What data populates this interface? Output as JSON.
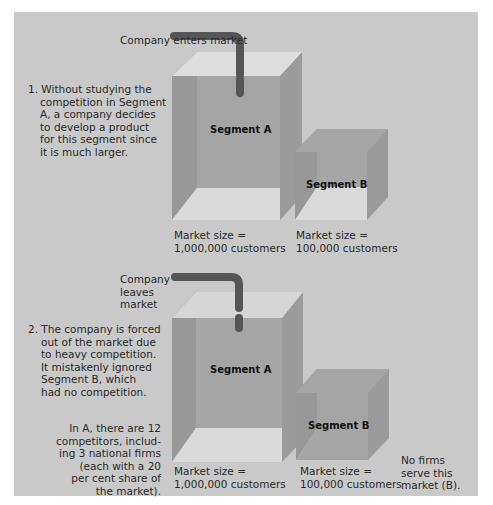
{
  "colors": {
    "background": "#c9c9c9",
    "top_face": "#dedede",
    "top_face_faded": "#d6d6d6",
    "left_wall": "#989898",
    "back_wall": "#a5a5a5",
    "right_face": "#9b9b9b",
    "floor": "#dadada",
    "pipe": "#555555"
  },
  "panel1": {
    "pipe_label": [
      "Company",
      "enters",
      "market"
    ],
    "description": [
      "1. Without studying the",
      "competition in Segment",
      "A, a company decides",
      "to develop a product",
      "for this segment since",
      "it is much larger."
    ],
    "segment_a": {
      "label": "Segment A",
      "market_size": [
        "Market size =",
        "1,000,000 customers"
      ],
      "customers": 1000000
    },
    "segment_b": {
      "label": "Segment B",
      "market_size": [
        "Market size =",
        "100,000 customers"
      ],
      "customers": 100000
    }
  },
  "panel2": {
    "pipe_label": [
      "Company",
      "leaves",
      "market"
    ],
    "description": [
      "2. The company is forced",
      "out of the market due",
      "to heavy competition.",
      "It mistakenly ignored",
      "Segment B, which",
      "had no competition."
    ],
    "competition_note": [
      "In A, there are 12",
      "competitors, includ-",
      "ing 3 national firms",
      "(each with a 20",
      "per cent share of",
      "the market)."
    ],
    "segment_a": {
      "label": "Segment A",
      "market_size": [
        "Market size =",
        "1,000,000 customers"
      ],
      "customers": 1000000
    },
    "segment_b": {
      "label": "Segment B",
      "market_size": [
        "Market size =",
        "100,000 customers"
      ],
      "customers": 100000
    },
    "segment_b_note": [
      "No firms",
      "serve this",
      "market (B)."
    ]
  }
}
